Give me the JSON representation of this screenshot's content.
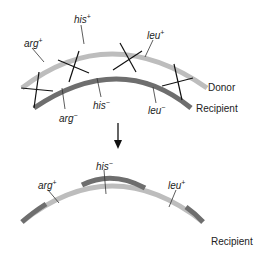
{
  "top": {
    "donor": {
      "name": "Donor",
      "color": "#bdbdbd"
    },
    "recipient": {
      "name": "Recipient",
      "color": "#6e6e6e"
    },
    "labels": {
      "arg_plus": {
        "gene": "arg",
        "sign": "+"
      },
      "his_plus": {
        "gene": "his",
        "sign": "+"
      },
      "leu_plus": {
        "gene": "leu",
        "sign": "+"
      },
      "arg_minus": {
        "gene": "arg",
        "sign": "−"
      },
      "his_minus": {
        "gene": "his",
        "sign": "−"
      },
      "leu_minus": {
        "gene": "leu",
        "sign": "−"
      }
    }
  },
  "arrow": {
    "direction": "down"
  },
  "bottom": {
    "recipient": {
      "name": "Recipient"
    },
    "labels": {
      "arg_plus": {
        "gene": "arg",
        "sign": "+"
      },
      "his_minus": {
        "gene": "his",
        "sign": "−"
      },
      "leu_plus": {
        "gene": "leu",
        "sign": "+"
      }
    },
    "segments": [
      "recipient",
      "donor",
      "recipient",
      "donor",
      "recipient"
    ]
  }
}
